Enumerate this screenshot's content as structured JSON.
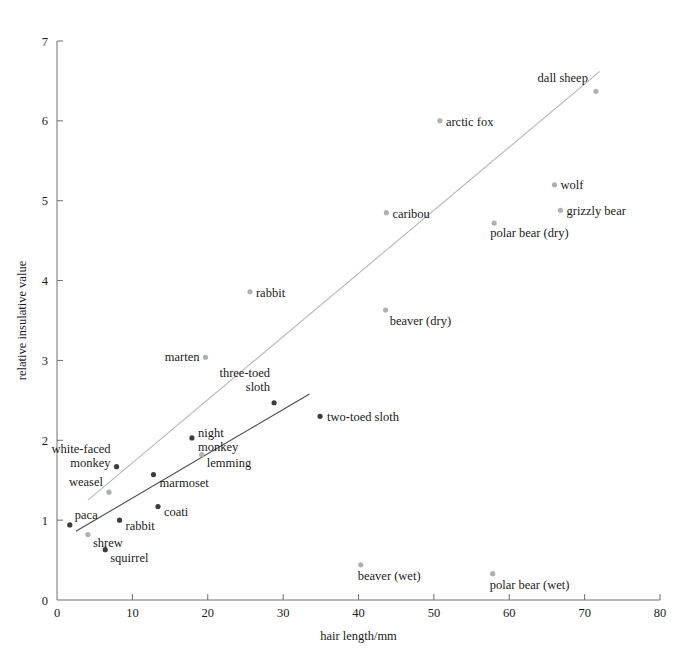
{
  "chart_data": {
    "type": "scatter",
    "title": "",
    "xlabel": "hair length/mm",
    "ylabel": "relative insulative value",
    "xlim": [
      0,
      80
    ],
    "ylim": [
      0,
      7
    ],
    "xticks": [
      0,
      10,
      20,
      30,
      40,
      50,
      60,
      70,
      80
    ],
    "yticks": [
      0,
      1,
      2,
      3,
      4,
      5,
      6,
      7
    ],
    "xtick_labels": [
      "0",
      "10",
      "20",
      "30",
      "40",
      "50",
      "60",
      "70",
      "80"
    ],
    "ytick_labels": [
      "0",
      "1",
      "2",
      "3",
      "4",
      "5",
      "6",
      "7"
    ],
    "grid": false,
    "legend": "none",
    "series": [
      {
        "name": "arctic/cold-climate mammals",
        "color": "#b0b0b0",
        "points": [
          {
            "label": "dall sheep",
            "x": 71.5,
            "y": 6.37,
            "label_dx": -8,
            "label_dy": -9,
            "label_anchor": "end"
          },
          {
            "label": "arctic fox",
            "x": 50.8,
            "y": 6.0,
            "label_dx": 6,
            "label_dy": 5,
            "label_anchor": "start"
          },
          {
            "label": "wolf",
            "x": 66.0,
            "y": 5.2,
            "label_dx": 6,
            "label_dy": 4,
            "label_anchor": "start"
          },
          {
            "label": "grizzly bear",
            "x": 66.8,
            "y": 4.88,
            "label_dx": 6,
            "label_dy": 5,
            "label_anchor": "start"
          },
          {
            "label": "polar bear (dry)",
            "x": 58.0,
            "y": 4.72,
            "label_dx": -4,
            "label_dy": 14,
            "label_anchor": "start"
          },
          {
            "label": "caribou",
            "x": 43.7,
            "y": 4.85,
            "label_dx": 6,
            "label_dy": 5,
            "label_anchor": "start"
          },
          {
            "label": "rabbit",
            "x": 25.6,
            "y": 3.86,
            "label_dx": 6,
            "label_dy": 5,
            "label_anchor": "start"
          },
          {
            "label": "beaver (dry)",
            "x": 43.6,
            "y": 3.63,
            "label_dx": 4,
            "label_dy": 15,
            "label_anchor": "start"
          },
          {
            "label": "marten",
            "x": 19.7,
            "y": 3.04,
            "label_dx": -6,
            "label_dy": 4,
            "label_anchor": "end"
          },
          {
            "label": "lemming",
            "x": 19.2,
            "y": 1.82,
            "label_dx": 5,
            "label_dy": 12,
            "label_anchor": "start"
          },
          {
            "label": "weasel",
            "x": 6.9,
            "y": 1.35,
            "label_dx": -6,
            "label_dy": -6,
            "label_anchor": "end"
          },
          {
            "label": "shrew",
            "x": 4.1,
            "y": 0.82,
            "label_dx": 5,
            "label_dy": 12,
            "label_anchor": "start"
          },
          {
            "label": "beaver (wet)",
            "x": 40.3,
            "y": 0.44,
            "label_dx": -3,
            "label_dy": 15,
            "label_anchor": "start"
          },
          {
            "label": "polar bear (wet)",
            "x": 57.8,
            "y": 0.33,
            "label_dx": -3,
            "label_dy": 15,
            "label_anchor": "start"
          }
        ]
      },
      {
        "name": "tropical mammals",
        "color": "#3d3d3d",
        "points": [
          {
            "label": "three-toed sloth",
            "x": 28.8,
            "y": 2.47,
            "label_dx": -4,
            "label_dy": -26,
            "label_anchor": "end"
          },
          {
            "label": "two-toed sloth",
            "x": 34.9,
            "y": 2.3,
            "label_dx": 7,
            "label_dy": 5,
            "label_anchor": "start"
          },
          {
            "label": "night monkey",
            "x": 17.9,
            "y": 2.03,
            "label_dx": 6,
            "label_dy": -1,
            "label_anchor": "start"
          },
          {
            "label": "white-faced monkey",
            "x": 7.9,
            "y": 1.67,
            "label_dx": -6,
            "label_dy": -14,
            "label_anchor": "end"
          },
          {
            "label": "marmoset",
            "x": 12.8,
            "y": 1.57,
            "label_dx": 6,
            "label_dy": 12,
            "label_anchor": "start"
          },
          {
            "label": "coati",
            "x": 13.4,
            "y": 1.17,
            "label_dx": 6,
            "label_dy": 9,
            "label_anchor": "start"
          },
          {
            "label": "rabbit",
            "x": 8.3,
            "y": 1.0,
            "label_dx": 6,
            "label_dy": 10,
            "label_anchor": "start"
          },
          {
            "label": "paca",
            "x": 1.7,
            "y": 0.94,
            "label_dx": 5,
            "label_dy": -6,
            "label_anchor": "start"
          },
          {
            "label": "squirrel",
            "x": 6.4,
            "y": 0.63,
            "label_dx": 5,
            "label_dy": 12,
            "label_anchor": "start"
          }
        ]
      }
    ],
    "trend_lines": [
      {
        "name": "arctic-trendline",
        "color": "#b7b7b7",
        "x1": 4.1,
        "y1": 1.25,
        "x2": 72.0,
        "y2": 6.62
      },
      {
        "name": "tropical-trendline",
        "color": "#4a4a4a",
        "x1": 2.5,
        "y1": 0.86,
        "x2": 33.5,
        "y2": 2.58
      }
    ],
    "multiline_labels": {
      "white-faced monkey": [
        "white-faced",
        "monkey"
      ],
      "night monkey": [
        "night",
        "monkey"
      ],
      "three-toed sloth": [
        "three-toed",
        "sloth"
      ]
    }
  }
}
